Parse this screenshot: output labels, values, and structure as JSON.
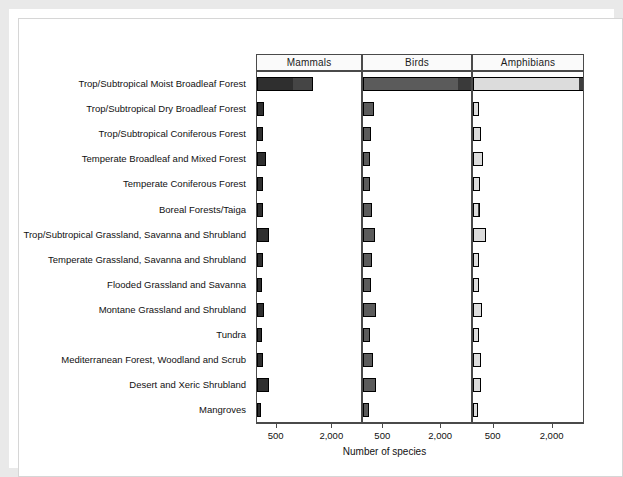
{
  "chart_data": {
    "type": "bar",
    "orientation": "horizontal",
    "stacked": true,
    "title": "",
    "xlabel": "Number of species",
    "ylabel": "",
    "facet_labels": [
      "Mammals",
      "Birds",
      "Amphibians"
    ],
    "xticks": [
      500,
      2000
    ],
    "xticklabels": [
      "500",
      "2,000"
    ],
    "xlim": [
      0,
      2800
    ],
    "grid": false,
    "legend": "none",
    "categories": [
      "Trop/Subtropical Moist Broadleaf Forest",
      "Trop/Subtropical Dry Broadleaf Forest",
      "Trop/Subtropical Coniferous Forest",
      "Temperate Broadleaf and Mixed Forest",
      "Temperate Coniferous Forest",
      "Boreal Forests/Taiga",
      "Trop/Subtropical Grassland, Savanna and Shrubland",
      "Temperate Grassland, Savanna and Shrubland",
      "Flooded Grassland and Savanna",
      "Montane Grassland and Shrubland",
      "Tundra",
      "Mediterranean Forest, Woodland and Scrub",
      "Desert and Xeric Shrubland",
      "Mangroves"
    ],
    "panels": [
      {
        "name": "Mammals",
        "fill": "#2f2f2f",
        "segment_fill": "#454545",
        "values": [
          980,
          175,
          150,
          230,
          160,
          150,
          330,
          150,
          140,
          185,
          135,
          165,
          310,
          120
        ],
        "segment_values": [
          520,
          0,
          0,
          0,
          0,
          0,
          0,
          0,
          0,
          0,
          0,
          0,
          0,
          0
        ]
      },
      {
        "name": "Birds",
        "fill": "#5b5b5b",
        "segment_fill": "#3a3a3a",
        "values": [
          2480,
          290,
          215,
          190,
          175,
          225,
          320,
          230,
          205,
          330,
          185,
          265,
          345,
          145
        ],
        "segment_values": [
          450,
          0,
          0,
          0,
          0,
          0,
          0,
          0,
          0,
          0,
          0,
          0,
          0,
          0
        ]
      },
      {
        "name": "Amphibians",
        "fill": "#dcdcdc",
        "segment_fill": "#3e3e3e",
        "values": [
          2700,
          165,
          195,
          255,
          190,
          140,
          320,
          160,
          165,
          225,
          150,
          215,
          200,
          120
        ],
        "segment_values": [
          900,
          0,
          0,
          0,
          0,
          50,
          0,
          0,
          0,
          0,
          0,
          0,
          0,
          0
        ]
      }
    ]
  }
}
